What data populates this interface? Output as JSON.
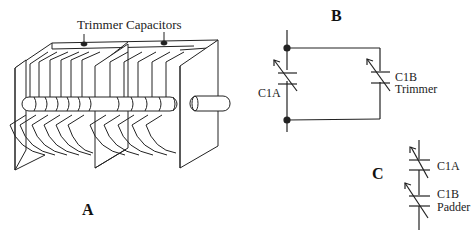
{
  "figure": {
    "panel_a": {
      "label": "A",
      "callout": "Trimmer Capacitors"
    },
    "panel_b": {
      "label": "B",
      "cap_main": "C1A",
      "cap_trim_name": "C1B",
      "cap_trim_role": "Trimmer"
    },
    "panel_c": {
      "label": "C",
      "cap_main": "C1A",
      "cap_pad_name": "C1B",
      "cap_pad_role": "Padder"
    }
  },
  "colors": {
    "line": "#222222",
    "background": "#ffffff"
  }
}
